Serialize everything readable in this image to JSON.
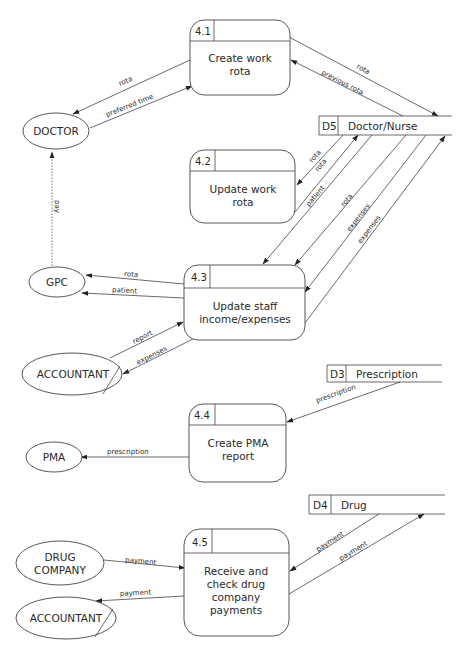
{
  "diagram": {
    "type": "data-flow-diagram",
    "processes": [
      {
        "id": "4.1",
        "title_lines": [
          "Create work",
          "rota"
        ]
      },
      {
        "id": "4.2",
        "title_lines": [
          "Update work",
          "rota"
        ]
      },
      {
        "id": "4.3",
        "title_lines": [
          "Update staff",
          "income/expenses"
        ]
      },
      {
        "id": "4.4",
        "title_lines": [
          "Create PMA",
          "report"
        ]
      },
      {
        "id": "4.5",
        "title_lines": [
          "Receive and",
          "check drug",
          "company",
          "payments"
        ]
      }
    ],
    "data_stores": [
      {
        "id": "D5",
        "name": "Doctor/Nurse"
      },
      {
        "id": "D3",
        "name": "Prescription"
      },
      {
        "id": "D4",
        "name": "Drug"
      }
    ],
    "external_entities": [
      {
        "key": "doctor",
        "lines": [
          "DOCTOR"
        ]
      },
      {
        "key": "gpc",
        "lines": [
          "GPC"
        ]
      },
      {
        "key": "accountant_1",
        "lines": [
          "ACCOUNTANT"
        ],
        "duplicate": true
      },
      {
        "key": "pma",
        "lines": [
          "PMA"
        ]
      },
      {
        "key": "drug_company",
        "lines": [
          "DRUG",
          "COMPANY"
        ]
      },
      {
        "key": "accountant_2",
        "lines": [
          "ACCOUNTANT"
        ],
        "duplicate": true
      }
    ],
    "flows": [
      {
        "label": "rota",
        "from": "4.1",
        "to": "DOCTOR"
      },
      {
        "label": "preferred time",
        "from": "DOCTOR",
        "to": "4.1"
      },
      {
        "label": "rota",
        "from": "4.1",
        "to": "D5"
      },
      {
        "label": "previous rota",
        "from": "D5",
        "to": "4.1"
      },
      {
        "label": "pay",
        "from": "GPC",
        "to": "DOCTOR",
        "style": "dotted"
      },
      {
        "label": "rota",
        "from": "D5",
        "to": "4.2"
      },
      {
        "label": "rota",
        "from": "4.2",
        "to": "D5"
      },
      {
        "label": "patient",
        "from": "D5",
        "to": "4.3"
      },
      {
        "label": "rota",
        "from": "D5",
        "to": "4.3"
      },
      {
        "label": "expenses",
        "from": "D5",
        "to": "4.3"
      },
      {
        "label": "expenses",
        "from": "4.3",
        "to": "D5"
      },
      {
        "label": "rota",
        "from": "4.3",
        "to": "GPC"
      },
      {
        "label": "patient",
        "from": "4.3",
        "to": "GPC"
      },
      {
        "label": "report",
        "from": "ACCOUNTANT",
        "to": "4.3"
      },
      {
        "label": "expenses",
        "from": "4.3",
        "to": "ACCOUNTANT"
      },
      {
        "label": "prescription",
        "from": "D3",
        "to": "4.4"
      },
      {
        "label": "prescription",
        "from": "4.4",
        "to": "PMA"
      },
      {
        "label": "payment",
        "from": "DRUG COMPANY",
        "to": "4.5"
      },
      {
        "label": "payment",
        "from": "4.5",
        "to": "ACCOUNTANT"
      },
      {
        "label": "payment",
        "from": "D4",
        "to": "4.5"
      },
      {
        "label": "payment",
        "from": "4.5",
        "to": "D4"
      }
    ]
  }
}
